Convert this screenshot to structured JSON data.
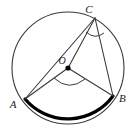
{
  "figure": {
    "kind": "circle-geometry-diagram",
    "background_color": "#ffffff",
    "stroke_color": "#3a3a3a",
    "bold_stroke_color": "#000000",
    "label_color": "#1a1a1a",
    "circle": {
      "center_label": "O",
      "center_x": 68,
      "center_y": 68,
      "radius": 56,
      "stroke_width": 1.1
    },
    "points": [
      {
        "name": "A",
        "label": "A",
        "x": 25,
        "y": 99,
        "label_x": 13,
        "label_y": 108
      },
      {
        "name": "B",
        "label": "B",
        "x": 113,
        "y": 96,
        "label_x": 119,
        "label_y": 102
      },
      {
        "name": "C",
        "label": "C",
        "x": 95,
        "y": 18,
        "label_x": 89,
        "label_y": 13
      },
      {
        "name": "O",
        "label": "O",
        "x": 68,
        "y": 68,
        "label_x": 62,
        "label_y": 64
      }
    ],
    "center_dot": {
      "x": 68,
      "y": 68,
      "radius": 2.6
    },
    "segments": [
      {
        "name": "segment-AC",
        "from": "A",
        "to": "C",
        "x1": 25,
        "y1": 99,
        "x2": 95,
        "y2": 18
      },
      {
        "name": "segment-AO",
        "from": "A",
        "to": "O",
        "x1": 25,
        "y1": 99,
        "x2": 68,
        "y2": 68
      },
      {
        "name": "segment-OB",
        "from": "O",
        "to": "B",
        "x1": 68,
        "y1": 68,
        "x2": 113,
        "y2": 96
      },
      {
        "name": "segment-OC",
        "from": "O",
        "to": "C",
        "x1": 68,
        "y1": 68,
        "x2": 95,
        "y2": 18
      },
      {
        "name": "segment-CB",
        "from": "C",
        "to": "B",
        "x1": 95,
        "y1": 18,
        "x2": 113,
        "y2": 96
      }
    ],
    "bold_arc": {
      "name": "major-arc-AB",
      "from": "A",
      "to": "B",
      "path": "M 25 99 A 56 56 0 0 0 113 96",
      "stroke_width": 3.2
    },
    "angle_marks": [
      {
        "name": "inscribed-angle-ACB",
        "vertex": "C",
        "path": "M 86 32 Q 95 40 104 33",
        "stroke_width": 1.0
      },
      {
        "name": "central-angle-AOB",
        "vertex": "O",
        "path": "M 54 78 Q 69 92 85 79",
        "stroke_width": 1.0
      }
    ]
  }
}
